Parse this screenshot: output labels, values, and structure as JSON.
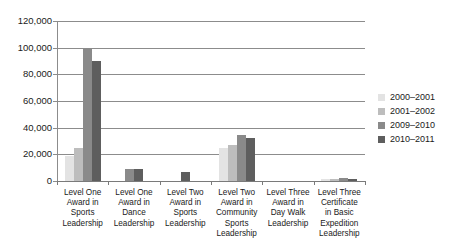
{
  "chart_data": {
    "type": "bar",
    "title": "",
    "subtitle": "",
    "xlabel": "",
    "ylabel": "",
    "ylim": [
      0,
      120000
    ],
    "ytick_labels": [
      "120,000",
      "100,000",
      "80,000",
      "60,000",
      "40,000",
      "20,000",
      "0"
    ],
    "ytick_values": [
      120000,
      100000,
      80000,
      60000,
      40000,
      20000,
      0
    ],
    "grid": true,
    "legend_position": "right",
    "categories": [
      "Level One Award in Sports Leadership",
      "Level One Award in Dance Leadership",
      "Level Two Award in Sports Leadership",
      "Level Two Award in Community Sports Leadership",
      "Level Three Award in Day Walk Leadership",
      "Level Three Certificate in Basic Expedition Leadership"
    ],
    "category_lines": [
      [
        "Level One",
        "Award in",
        "Sports",
        "Leadership"
      ],
      [
        "Level One",
        "Award in",
        "Dance",
        "Leadership"
      ],
      [
        "Level Two",
        "Award in",
        "Sports",
        "Leadership"
      ],
      [
        "Level Two",
        "Award in",
        "Community",
        "Sports",
        "Leadership"
      ],
      [
        "Level Three",
        "Award in",
        "Day Walk",
        "Leadership"
      ],
      [
        "Level Three",
        "Certificate",
        "in Basic",
        "Expedition",
        "Leadership"
      ]
    ],
    "series": [
      {
        "name": "2000–2001",
        "color": "#e3e3e3",
        "values": [
          19000,
          0,
          0,
          24500,
          0,
          1200
        ]
      },
      {
        "name": "2001–2002",
        "color": "#bdbdbd",
        "values": [
          25000,
          0,
          0,
          27000,
          0,
          1400
        ]
      },
      {
        "name": "2009–2010",
        "color": "#8a8a8a",
        "values": [
          100000,
          9000,
          0,
          34500,
          0,
          1900
        ]
      },
      {
        "name": "2010–2011",
        "color": "#5e5e5e",
        "values": [
          90000,
          8800,
          7000,
          32000,
          0,
          1800
        ]
      }
    ]
  },
  "legend": {
    "entries": [
      {
        "label": "2000–2001"
      },
      {
        "label": "2001–2002"
      },
      {
        "label": "2009–2010"
      },
      {
        "label": "2010–2011"
      }
    ]
  }
}
